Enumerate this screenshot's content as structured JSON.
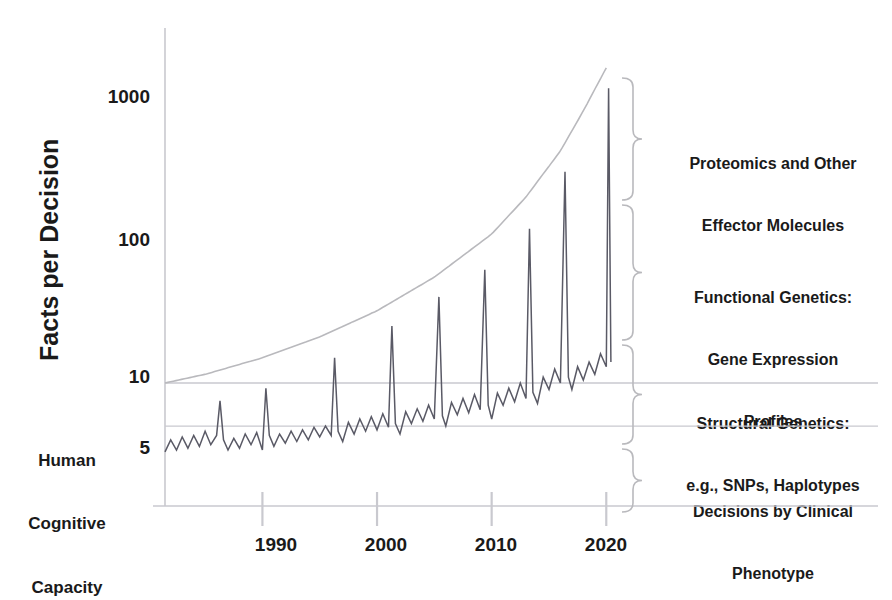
{
  "figure": {
    "axis_title_y": "Facts per Decision",
    "background": "#ffffff",
    "line_color": "#5a5a66",
    "envelope_color": "#b9b9bd",
    "grid_color": "#c9c9cf",
    "text_color": "#1a1a1a"
  },
  "axes": {
    "y_ticks": [
      {
        "label": "1000",
        "value": 1000
      },
      {
        "label": "100",
        "value": 100
      },
      {
        "label": "10",
        "value": 10
      },
      {
        "label": "5",
        "value": 5
      }
    ],
    "x_ticks": [
      {
        "label": "1990",
        "value": 1990
      },
      {
        "label": "2000",
        "value": 2000
      },
      {
        "label": "2010",
        "value": 2010
      },
      {
        "label": "2020",
        "value": 2020
      }
    ]
  },
  "threshold_note": {
    "line1": "Human",
    "line2": "Cognitive",
    "line3": "Capacity",
    "value": 5
  },
  "annotations": [
    {
      "id": "proteomics",
      "line1": "Proteomics and Other",
      "line2": "Effector Molecules",
      "line3": ""
    },
    {
      "id": "functional",
      "line1": "Functional Genetics:",
      "line2": "Gene Expression",
      "line3": "Profiles"
    },
    {
      "id": "structural",
      "line1": "Structural Genetics:",
      "line2": "e.g., SNPs, Haplotypes",
      "line3": ""
    },
    {
      "id": "clinical",
      "line1": "Decisions by Clinical",
      "line2": "Phenotype",
      "line3": ""
    }
  ],
  "chart_data": {
    "type": "line",
    "title": "",
    "xlabel": "",
    "ylabel": "Facts per Decision",
    "yscale": "log",
    "ylim": [
      3,
      2500
    ],
    "xlim": [
      1981.5,
      2020.5
    ],
    "grid": true,
    "legend": "none",
    "gridlines_y": [
      10,
      5
    ],
    "annotation_threshold": {
      "label": "Human Cognitive Capacity",
      "y": 5
    },
    "envelope": {
      "name": "Upper envelope of information growth",
      "x": [
        1981.5,
        1985,
        1990,
        1995,
        2000,
        2005,
        2010,
        2013,
        2016,
        2018,
        2020
      ],
      "y": [
        10,
        11.5,
        15,
        21,
        32,
        55,
        110,
        200,
        420,
        800,
        1600
      ]
    },
    "series": [
      {
        "name": "Facts per decision",
        "x": [
          1981.5,
          1982.0,
          1982.5,
          1983.0,
          1983.5,
          1984.0,
          1984.5,
          1985.0,
          1985.5,
          1986.0,
          1986.3,
          1986.6,
          1987.0,
          1987.5,
          1988.0,
          1988.5,
          1989.0,
          1989.5,
          1990.0,
          1990.3,
          1990.6,
          1991.0,
          1991.5,
          1992.0,
          1992.5,
          1993.0,
          1993.5,
          1994.0,
          1994.5,
          1995.0,
          1995.5,
          1996.0,
          1996.3,
          1996.6,
          1997.0,
          1997.5,
          1998.0,
          1998.5,
          1999.0,
          1999.5,
          2000.0,
          2000.5,
          2001.0,
          2001.3,
          2001.6,
          2002.0,
          2002.5,
          2003.0,
          2003.5,
          2004.0,
          2004.5,
          2005.0,
          2005.4,
          2005.7,
          2006.0,
          2006.5,
          2007.0,
          2007.5,
          2008.0,
          2008.5,
          2009.0,
          2009.4,
          2009.7,
          2010.0,
          2010.5,
          2011.0,
          2011.5,
          2012.0,
          2012.5,
          2013.0,
          2013.3,
          2013.6,
          2014.0,
          2014.5,
          2015.0,
          2015.5,
          2016.0,
          2016.4,
          2016.7,
          2017.0,
          2017.5,
          2018.0,
          2018.5,
          2019.0,
          2019.5,
          2020.0,
          2020.2,
          2020.4
        ],
        "y": [
          3.3,
          4.0,
          3.4,
          4.2,
          3.5,
          4.3,
          3.6,
          4.6,
          3.7,
          4.3,
          7.5,
          4.0,
          3.4,
          4.1,
          3.5,
          4.4,
          3.7,
          4.5,
          3.4,
          9.2,
          4.3,
          3.6,
          4.4,
          3.8,
          4.6,
          3.9,
          4.7,
          4.0,
          4.9,
          4.2,
          5.0,
          4.3,
          15.0,
          4.6,
          3.9,
          5.3,
          4.4,
          5.6,
          4.6,
          5.8,
          4.7,
          6.1,
          4.9,
          25.0,
          5.2,
          4.4,
          6.3,
          5.2,
          6.6,
          5.4,
          7.0,
          5.6,
          40.0,
          5.9,
          5.0,
          7.3,
          6.0,
          7.8,
          6.2,
          8.3,
          6.5,
          62.0,
          7.0,
          5.6,
          8.5,
          7.0,
          9.2,
          7.4,
          10.0,
          7.8,
          120.0,
          8.6,
          7.2,
          11.0,
          9.0,
          12.5,
          10.0,
          300.0,
          11.0,
          9.0,
          13.0,
          10.5,
          14.0,
          11.5,
          16.0,
          13.0,
          1150.0,
          14.0
        ]
      }
    ]
  }
}
